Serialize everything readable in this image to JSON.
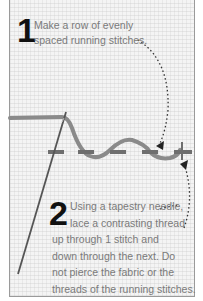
{
  "steps": [
    {
      "number": "1",
      "text_lines": [
        "Make a row of evenly",
        "spaced running stitches."
      ]
    },
    {
      "number": "2",
      "text_lines": [
        "Using a tapestry needle,",
        "lace a contrasting thread",
        "up through 1 stitch and",
        "down through the next. Do",
        "not pierce the fabric or the",
        "threads of the running stitches."
      ]
    }
  ],
  "colors": {
    "fabric": "#f4f4f4",
    "frame_border": "#9a9a9a",
    "running_stitch": "#707070",
    "lacing_thread": "#8a8a8a",
    "needle": "#555555",
    "arrow": "#333333",
    "text": "#7a7a7a",
    "number": "#111111"
  }
}
